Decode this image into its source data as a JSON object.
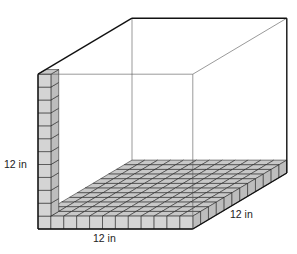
{
  "diagram": {
    "type": "3d-box-unit-cubes",
    "labels": {
      "height": "12 in",
      "width": "12 in",
      "depth": "12 in"
    },
    "grid": {
      "cols": 12,
      "rows": 12,
      "column_height": 12
    },
    "colors": {
      "cube_fill": "#d4d4d4",
      "cube_top": "#c8c8c8",
      "cube_side": "#bdbdbd",
      "edge": "#111111",
      "thin_edge": "#555555"
    }
  }
}
